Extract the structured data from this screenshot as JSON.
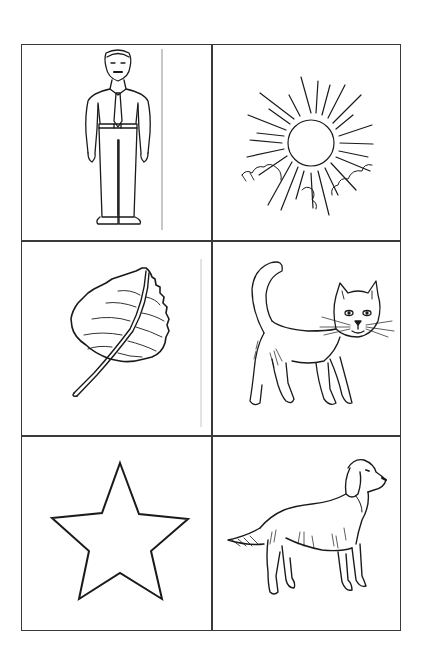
{
  "worksheet": {
    "layout": {
      "columns": 2,
      "rows": 3
    },
    "colors": {
      "background": "#ffffff",
      "grid_line": "#3a3a3a",
      "ink": "#1a1a1a",
      "guide_line": "#c8c8c8"
    },
    "cells": [
      {
        "row": 1,
        "col": 1,
        "subject": "man"
      },
      {
        "row": 1,
        "col": 2,
        "subject": "sun"
      },
      {
        "row": 2,
        "col": 1,
        "subject": "leaf"
      },
      {
        "row": 2,
        "col": 2,
        "subject": "cat"
      },
      {
        "row": 3,
        "col": 1,
        "subject": "star"
      },
      {
        "row": 3,
        "col": 2,
        "subject": "dog"
      }
    ]
  }
}
